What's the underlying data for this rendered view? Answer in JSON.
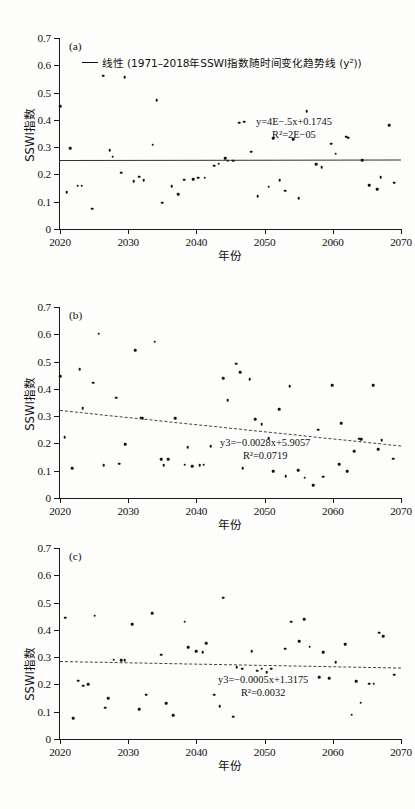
{
  "figure": {
    "panels": [
      "a",
      "b",
      "c"
    ],
    "axis": {
      "xlabel": "年份",
      "ylabel": "SSWI指数",
      "xlim": [
        2020,
        2070
      ],
      "ylim": [
        0,
        0.7
      ],
      "xticks": [
        "2020",
        "2030",
        "2040",
        "2050",
        "2060",
        "2070"
      ],
      "yticks": [
        "0",
        "0.1",
        "0.2",
        "0.3",
        "0.4",
        "0.5",
        "0.6",
        "0.7"
      ]
    },
    "legend": {
      "label": "线性 (1971–2018年SSWI指数随时间变化趋势线 (y²))",
      "marker": "solid-line"
    }
  },
  "chart_data": [
    {
      "type": "scatter",
      "panel": "(a)",
      "title": "",
      "xlabel": "年份",
      "ylabel": "SSWI指数",
      "xlim": [
        2020,
        2070
      ],
      "ylim": [
        0,
        0.7
      ],
      "grid": false,
      "legend_position": "top-left",
      "equation": "y=4E−.5x+0.1745",
      "r2": "R²=2E−05",
      "trendline": {
        "style": "solid",
        "y_start": 0.253,
        "y_end": 0.255
      },
      "x": [
        2020,
        2021,
        2021.5,
        2022.6,
        2023.2,
        2024.7,
        2026.3,
        2027.3,
        2027.7,
        2029,
        2029.5,
        2030.8,
        2031.6,
        2032.3,
        2033.6,
        2034.2,
        2035,
        2036.4,
        2037.3,
        2038.2,
        2039.5,
        2040.3,
        2041.2,
        2042.6,
        2043.3,
        2044.2,
        2044.6,
        2045.4,
        2046.3,
        2047,
        2048,
        2049,
        2050.6,
        2051.3,
        2052.2,
        2053,
        2054.2,
        2055,
        2056.2,
        2057.6,
        2058.4,
        2059.8,
        2060.4,
        2062,
        2062.3,
        2064.3,
        2065.3,
        2066.5,
        2067,
        2068.3,
        2069
      ],
      "y": [
        0.451,
        0.135,
        0.296,
        0.159,
        0.159,
        0.074,
        0.562,
        0.289,
        0.265,
        0.206,
        0.556,
        0.175,
        0.191,
        0.178,
        0.309,
        0.471,
        0.096,
        0.156,
        0.128,
        0.181,
        0.183,
        0.188,
        0.188,
        0.232,
        0.239,
        0.259,
        0.251,
        0.251,
        0.389,
        0.393,
        0.283,
        0.121,
        0.155,
        0.333,
        0.179,
        0.141,
        0.329,
        0.113,
        0.432,
        0.237,
        0.227,
        0.313,
        0.276,
        0.338,
        0.335,
        0.253,
        0.161,
        0.145,
        0.19,
        0.38,
        0.169
      ]
    },
    {
      "type": "scatter",
      "panel": "(b)",
      "title": "",
      "xlabel": "年份",
      "ylabel": "SSWI指数",
      "xlim": [
        2020,
        2070
      ],
      "ylim": [
        0,
        0.7
      ],
      "grid": false,
      "legend_position": "none",
      "equation": "y3=−0.0028x+5.9057",
      "r2": "R²=0.0719",
      "trendline": {
        "style": "dashed",
        "y_start": 0.322,
        "y_end": 0.192
      },
      "x": [
        2020,
        2020.7,
        2021.8,
        2022.9,
        2023.3,
        2024.9,
        2025.7,
        2026.4,
        2028.2,
        2028.7,
        2029.6,
        2031,
        2031.9,
        2032.1,
        2033.9,
        2034.8,
        2035.2,
        2035.9,
        2036.9,
        2038.3,
        2038.7,
        2039.4,
        2040.5,
        2041.1,
        2042.1,
        2043.9,
        2044.6,
        2045.8,
        2046.4,
        2046.8,
        2047.8,
        2048.6,
        2049.6,
        2050.6,
        2051.3,
        2052.1,
        2053.1,
        2053.7,
        2054.9,
        2055.9,
        2057.1,
        2057.9,
        2058.6,
        2059.9,
        2060.9,
        2061.2,
        2062.1,
        2063.1,
        2063.9,
        2064.2,
        2065.9,
        2066.7,
        2067.2,
        2068.9
      ],
      "y": [
        0.447,
        0.223,
        0.11,
        0.472,
        0.329,
        0.423,
        0.602,
        0.121,
        0.368,
        0.126,
        0.198,
        0.542,
        0.295,
        0.292,
        0.573,
        0.142,
        0.12,
        0.142,
        0.292,
        0.122,
        0.186,
        0.116,
        0.121,
        0.122,
        0.19,
        0.44,
        0.358,
        0.492,
        0.462,
        0.11,
        0.435,
        0.288,
        0.27,
        0.22,
        0.099,
        0.325,
        0.079,
        0.41,
        0.102,
        0.074,
        0.046,
        0.25,
        0.078,
        0.414,
        0.124,
        0.274,
        0.099,
        0.172,
        0.218,
        0.215,
        0.414,
        0.179,
        0.211,
        0.144
      ]
    },
    {
      "type": "scatter",
      "panel": "(c)",
      "title": "",
      "xlabel": "年份",
      "ylabel": "SSWI指数",
      "xlim": [
        2020,
        2070
      ],
      "ylim": [
        0,
        0.7
      ],
      "grid": false,
      "legend_position": "none",
      "equation": "y3=−0.0005x+1.3175",
      "r2": "R²=0.0032",
      "trendline": {
        "style": "dashed",
        "y_start": 0.287,
        "y_end": 0.263
      },
      "x": [
        2020.8,
        2021.9,
        2022.7,
        2023.4,
        2024.1,
        2025.1,
        2026.6,
        2027.1,
        2027.9,
        2029,
        2029.5,
        2030.6,
        2031.6,
        2032.6,
        2033.5,
        2034.8,
        2035.6,
        2036.6,
        2038.3,
        2038.8,
        2040,
        2040.9,
        2041.4,
        2042.6,
        2043.4,
        2043.9,
        2045.4,
        2045.9,
        2046.7,
        2048.1,
        2048.9,
        2049.6,
        2050.3,
        2051,
        2053,
        2053.9,
        2055.1,
        2055.8,
        2056.6,
        2058,
        2058.6,
        2059.5,
        2060.4,
        2061.8,
        2062.8,
        2063.4,
        2064.1,
        2065.3,
        2066,
        2066.8,
        2067.4,
        2069
      ],
      "y": [
        0.444,
        0.077,
        0.214,
        0.195,
        0.201,
        0.452,
        0.114,
        0.149,
        0.29,
        0.289,
        0.288,
        0.42,
        0.11,
        0.162,
        0.461,
        0.309,
        0.132,
        0.087,
        0.43,
        0.336,
        0.322,
        0.318,
        0.351,
        0.162,
        0.12,
        0.518,
        0.082,
        0.263,
        0.258,
        0.322,
        0.25,
        0.257,
        0.244,
        0.258,
        0.331,
        0.43,
        0.358,
        0.44,
        0.338,
        0.227,
        0.318,
        0.223,
        0.281,
        0.347,
        0.089,
        0.212,
        0.133,
        0.203,
        0.202,
        0.39,
        0.377,
        0.236
      ]
    }
  ]
}
